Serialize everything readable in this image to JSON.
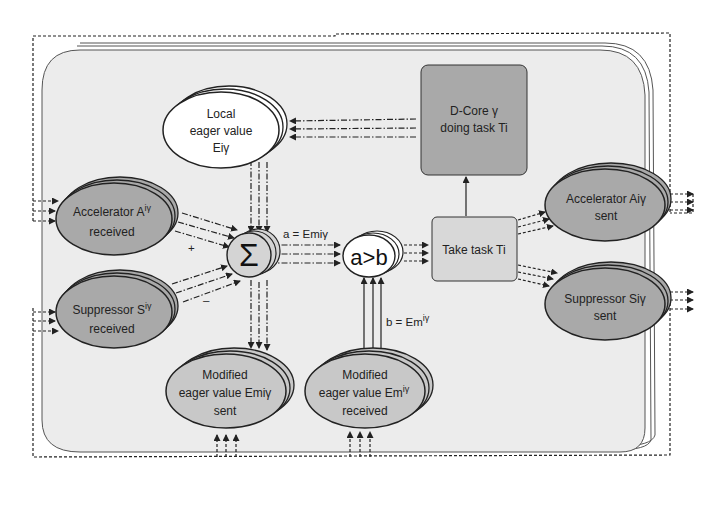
{
  "diagram": {
    "colors": {
      "background": "#ffffff",
      "panel_fill": "#ececec",
      "dark_node_fill": "#a9a9a9",
      "mid_node_fill": "#c8c8c8",
      "light_node_fill": "#ffffff",
      "stroke": "#222222"
    },
    "nodes": {
      "local_eager": {
        "line1": "Local",
        "line2": "eager value",
        "line3": "Eiγ"
      },
      "dcore": {
        "line1": "D-Core γ",
        "line2": "doing task Ti"
      },
      "accel_received": {
        "line1": "Accelerator A",
        "sup": "iγ",
        "line2": "received"
      },
      "suppr_received": {
        "line1": "Suppressor S",
        "sup": "iγ",
        "line2": "received"
      },
      "sigma": {
        "symbol": "Σ"
      },
      "compare": {
        "symbol": "a>b"
      },
      "take_task": {
        "label": "Take task Ti"
      },
      "accel_sent": {
        "line1": "Accelerator Aiγ",
        "line2": "sent"
      },
      "suppr_sent": {
        "line1": "Suppressor Siγ",
        "line2": "sent"
      },
      "mod_sent": {
        "line1": "Modified",
        "line2": "eager value Emiγ",
        "line3": "sent"
      },
      "mod_received": {
        "line1": "Modified",
        "line2": "eager value Em",
        "sup": "iγ",
        "line3": "received"
      }
    },
    "edge_labels": {
      "a_eq": "a = Emiγ",
      "b_eq": "b = Em",
      "b_sup": "iγ",
      "plus": "+",
      "minus": "–"
    }
  }
}
